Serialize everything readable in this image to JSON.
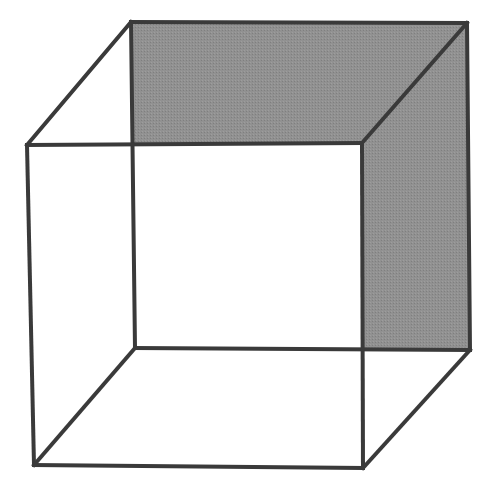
{
  "document": {
    "title": "Necker Cube",
    "background_color": "#ffffff",
    "width": 484,
    "height": 496
  },
  "figure": {
    "name": "necker-cube",
    "projection": "oblique",
    "line_color": "#3a3a3a",
    "line_width": 4,
    "fill_color": "#909090",
    "fill_style": "halftone-dither",
    "background_color": "#ffffff",
    "faces": [
      {
        "name": "back-face",
        "label": "Back face (shaded)",
        "filled": true,
        "fill_color": "#909090",
        "points": "131,22 467,23 470,350 135,348"
      },
      {
        "name": "top-connector-face",
        "label": "Top face (shaded)",
        "filled": true,
        "fill_color": "#909090",
        "points": "131,22 467,23 362,143 135,145"
      },
      {
        "name": "right-connector-face",
        "label": "Right face (shaded)",
        "filled": true,
        "fill_color": "#909090",
        "points": "467,23 470,350 363,348 362,143"
      },
      {
        "name": "front-face",
        "label": "Front face (unshaded)",
        "filled": false,
        "fill_color": "#ffffff",
        "points": "27,145 362,143 363,468 34,465"
      }
    ],
    "vertices": [
      {
        "name": "back-top-left",
        "x": 131,
        "y": 22
      },
      {
        "name": "back-top-right",
        "x": 467,
        "y": 23
      },
      {
        "name": "back-bottom-right",
        "x": 470,
        "y": 350
      },
      {
        "name": "back-bottom-left",
        "x": 135,
        "y": 348
      },
      {
        "name": "front-top-left",
        "x": 27,
        "y": 145
      },
      {
        "name": "front-top-right",
        "x": 362,
        "y": 143
      },
      {
        "name": "front-bottom-right",
        "x": 363,
        "y": 468
      },
      {
        "name": "front-bottom-left",
        "x": 34,
        "y": 465
      }
    ],
    "edges": [
      {
        "name": "back-top-edge",
        "x1": 131,
        "y1": 22,
        "x2": 467,
        "y2": 23
      },
      {
        "name": "back-right-edge",
        "x1": 467,
        "y1": 23,
        "x2": 470,
        "y2": 350
      },
      {
        "name": "back-bottom-edge",
        "x1": 470,
        "y1": 350,
        "x2": 135,
        "y2": 348
      },
      {
        "name": "back-left-edge",
        "x1": 135,
        "y1": 348,
        "x2": 131,
        "y2": 22
      },
      {
        "name": "front-top-edge",
        "x1": 27,
        "y1": 145,
        "x2": 362,
        "y2": 143
      },
      {
        "name": "front-right-edge",
        "x1": 362,
        "y1": 143,
        "x2": 363,
        "y2": 468
      },
      {
        "name": "front-bottom-edge",
        "x1": 363,
        "y1": 468,
        "x2": 34,
        "y2": 465
      },
      {
        "name": "front-left-edge",
        "x1": 34,
        "y1": 465,
        "x2": 27,
        "y2": 145
      },
      {
        "name": "connector-top-left",
        "x1": 27,
        "y1": 145,
        "x2": 131,
        "y2": 22
      },
      {
        "name": "connector-top-right",
        "x1": 362,
        "y1": 143,
        "x2": 467,
        "y2": 23
      },
      {
        "name": "connector-bottom-right",
        "x1": 363,
        "y1": 468,
        "x2": 470,
        "y2": 350
      },
      {
        "name": "connector-bottom-left",
        "x1": 34,
        "y1": 465,
        "x2": 135,
        "y2": 348
      }
    ]
  }
}
